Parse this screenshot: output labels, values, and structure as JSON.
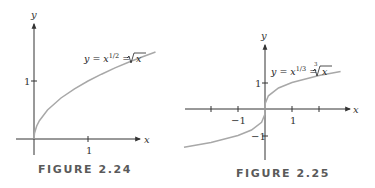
{
  "chart_data": [
    {
      "type": "line",
      "figure_label": "FIGURE 2.24",
      "title": "",
      "annotation": "y = x^{1/2} = √x",
      "annotation_parts": {
        "lhs": "y = x",
        "exp": "1/2",
        "mid": " = ",
        "rad": "x"
      },
      "xlabel": "x",
      "ylabel": "y",
      "x_ticks": [
        {
          "value": 1,
          "label": "1"
        }
      ],
      "y_ticks": [
        {
          "value": 1,
          "label": "1"
        }
      ],
      "xlim": [
        -0.5,
        2.2
      ],
      "ylim": [
        -0.5,
        2.3
      ],
      "grid": false,
      "series": [
        {
          "name": "y = sqrt(x)",
          "x": [
            0,
            0.01,
            0.05,
            0.1,
            0.25,
            0.5,
            0.75,
            1,
            1.25,
            1.5,
            1.75,
            2.0,
            2.25
          ],
          "y": [
            0,
            0.1,
            0.224,
            0.316,
            0.5,
            0.707,
            0.866,
            1,
            1.118,
            1.225,
            1.323,
            1.414,
            1.5
          ]
        }
      ],
      "colors": {
        "curve": "#a8a8a8",
        "axes": "#333333"
      }
    },
    {
      "type": "line",
      "figure_label": "FIGURE 2.25",
      "title": "",
      "annotation": "y = x^{1/3} = ∛x",
      "annotation_parts": {
        "lhs": "y = x",
        "exp": "1/3",
        "mid": " = ",
        "root_index": "3",
        "rad": "x"
      },
      "xlabel": "x",
      "ylabel": "y",
      "x_ticks": [
        {
          "value": -2,
          "label": ""
        },
        {
          "value": -1,
          "label": "−1"
        },
        {
          "value": 1,
          "label": "1"
        },
        {
          "value": 2,
          "label": ""
        }
      ],
      "y_ticks": [
        {
          "value": 1,
          "label": "1"
        },
        {
          "value": -1,
          "label": "−1"
        }
      ],
      "xlim": [
        -3,
        2.5
      ],
      "ylim": [
        -1.6,
        2.3
      ],
      "grid": false,
      "series": [
        {
          "name": "y = cbrt(x)",
          "x": [
            -3,
            -2,
            -1,
            -0.5,
            -0.125,
            -0.01,
            0,
            0.01,
            0.125,
            0.5,
            1,
            2,
            2.8
          ],
          "y": [
            -1.442,
            -1.26,
            -1,
            -0.794,
            -0.5,
            -0.215,
            0,
            0.215,
            0.5,
            0.794,
            1,
            1.26,
            1.41
          ]
        }
      ],
      "colors": {
        "curve": "#a8a8a8",
        "axes": "#333333"
      }
    }
  ]
}
